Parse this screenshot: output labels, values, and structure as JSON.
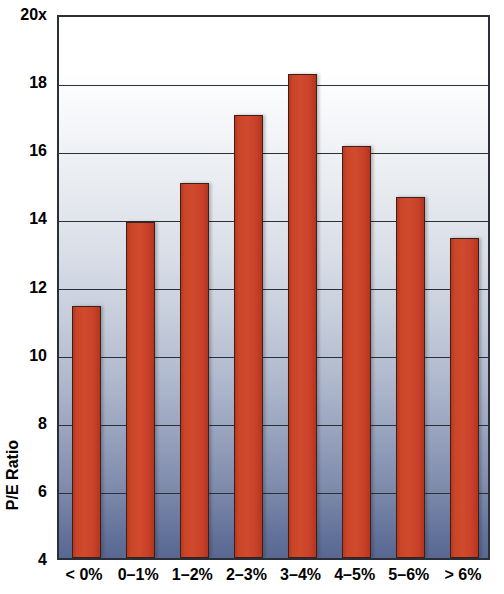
{
  "chart_data": {
    "type": "bar",
    "title": "",
    "subtitle": "",
    "xlabel": "",
    "ylabel": "P/E Ratio",
    "categories": [
      "< 0%",
      "0–1%",
      "1–2%",
      "2–3%",
      "3–4%",
      "4–5%",
      "5–6%",
      "> 6%"
    ],
    "values": [
      11.4,
      13.85,
      15.0,
      17.0,
      18.2,
      16.1,
      14.6,
      13.4
    ],
    "series": [
      {
        "name": "P/E Ratio",
        "values": [
          11.4,
          13.85,
          15.0,
          17.0,
          18.2,
          16.1,
          14.6,
          13.4
        ]
      }
    ],
    "ylim": [
      4,
      20
    ],
    "yticks": [
      4,
      6,
      8,
      10,
      12,
      14,
      16,
      18,
      20
    ],
    "ytick_labels": [
      "4",
      "6",
      "8",
      "10",
      "12",
      "14",
      "16",
      "18",
      "20x"
    ],
    "grid": true,
    "grid_axis": "y",
    "legend": false,
    "legend_position": "none",
    "bar_color": "#c8402a",
    "bar_outline_color": "#3a2018",
    "axis_color": "#2b2f38",
    "plot_background_top_color": "#ffffff",
    "plot_background_bottom_color": "#586891",
    "annotations": []
  }
}
